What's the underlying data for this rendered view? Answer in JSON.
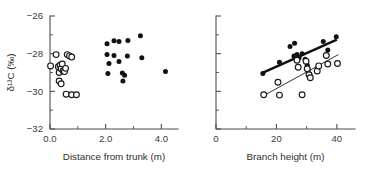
{
  "figure": {
    "background": "#ffffff",
    "marker_filled_color": "#111111",
    "marker_open_stroke": "#1a1a1a",
    "axis_color": "#4d4d4d"
  },
  "chart_data": [
    {
      "type": "scatter",
      "panel": "left",
      "title": "",
      "xlabel": "Distance from trunk (m)",
      "ylabel": "δ¹³C (‰)",
      "xlim": [
        0.0,
        4.6
      ],
      "ylim": [
        -32,
        -26
      ],
      "grid": false,
      "legend": "none",
      "xticks": [
        0.0,
        2.0,
        4.0
      ],
      "xtick_labels": [
        "0.0",
        "2.0",
        "4.0"
      ],
      "xminor": [
        1.0,
        3.0
      ],
      "yticks": [
        -26,
        -28,
        -30,
        -32
      ],
      "ytick_labels": [
        "−26",
        "−28",
        "−30",
        "−32"
      ],
      "yminor": [
        -27,
        -29,
        -31
      ],
      "series": [
        {
          "name": "open circles",
          "marker": "open-circle",
          "points": [
            [
              0.02,
              -28.65
            ],
            [
              0.22,
              -28.05
            ],
            [
              0.3,
              -28.7
            ],
            [
              0.33,
              -29.0
            ],
            [
              0.36,
              -28.62
            ],
            [
              0.4,
              -28.8
            ],
            [
              0.44,
              -28.55
            ],
            [
              0.47,
              -28.92
            ],
            [
              0.33,
              -29.45
            ],
            [
              0.4,
              -29.6
            ],
            [
              0.52,
              -28.95
            ],
            [
              0.56,
              -28.78
            ],
            [
              0.62,
              -28.05
            ],
            [
              0.7,
              -28.12
            ],
            [
              0.78,
              -28.18
            ],
            [
              0.58,
              -30.15
            ],
            [
              0.78,
              -30.18
            ],
            [
              0.95,
              -30.18
            ]
          ]
        },
        {
          "name": "filled circles",
          "marker": "filled-circle",
          "points": [
            [
              2.05,
              -27.48
            ],
            [
              2.3,
              -27.32
            ],
            [
              2.48,
              -27.35
            ],
            [
              2.8,
              -27.3
            ],
            [
              3.25,
              -27.05
            ],
            [
              2.05,
              -28.05
            ],
            [
              2.3,
              -28.1
            ],
            [
              2.12,
              -28.52
            ],
            [
              2.48,
              -28.42
            ],
            [
              2.78,
              -28.12
            ],
            [
              3.3,
              -28.22
            ],
            [
              2.08,
              -29.05
            ],
            [
              2.6,
              -29.02
            ],
            [
              2.68,
              -29.15
            ],
            [
              2.62,
              -29.45
            ],
            [
              4.15,
              -28.95
            ]
          ]
        }
      ]
    },
    {
      "type": "scatter",
      "panel": "right",
      "title": "",
      "xlabel": "Branch height (m)",
      "ylabel": "",
      "xlim": [
        0,
        46
      ],
      "ylim": [
        -32,
        -26
      ],
      "grid": false,
      "legend": "none",
      "xticks": [
        0,
        20,
        40
      ],
      "xtick_labels": [
        "0",
        "20",
        "40"
      ],
      "xminor": [
        10,
        30
      ],
      "yticks": [
        -26,
        -28,
        -30,
        -32
      ],
      "ytick_labels": [
        "",
        "",
        "",
        ""
      ],
      "yminor": [
        -27,
        -29,
        -31
      ],
      "series": [
        {
          "name": "filled circles",
          "marker": "filled-circle",
          "points": [
            [
              15.5,
              -29.05
            ],
            [
              21.0,
              -28.45
            ],
            [
              24.5,
              -27.62
            ],
            [
              26.0,
              -27.45
            ],
            [
              25.8,
              -28.12
            ],
            [
              26.8,
              -28.05
            ],
            [
              27.5,
              -28.22
            ],
            [
              28.5,
              -28.0
            ],
            [
              29.5,
              -28.3
            ],
            [
              30.2,
              -28.62
            ],
            [
              30.5,
              -28.85
            ],
            [
              31.0,
              -29.08
            ],
            [
              33.5,
              -28.95
            ],
            [
              35.5,
              -27.35
            ],
            [
              37.0,
              -27.8
            ],
            [
              39.8,
              -27.1
            ]
          ]
        },
        {
          "name": "open circles",
          "marker": "open-circle",
          "points": [
            [
              15.8,
              -30.18
            ],
            [
              20.5,
              -29.52
            ],
            [
              21.0,
              -30.2
            ],
            [
              26.8,
              -28.35
            ],
            [
              27.2,
              -28.72
            ],
            [
              28.5,
              -30.18
            ],
            [
              29.8,
              -28.4
            ],
            [
              30.2,
              -28.8
            ],
            [
              30.8,
              -29.12
            ],
            [
              31.2,
              -29.28
            ],
            [
              33.5,
              -28.92
            ],
            [
              34.0,
              -28.65
            ],
            [
              36.5,
              -28.1
            ],
            [
              37.0,
              -28.55
            ],
            [
              40.2,
              -28.52
            ]
          ]
        }
      ],
      "fit_lines": [
        {
          "name": "upper regression (filled)",
          "style": "thick",
          "x1": 15.0,
          "y1": -29.05,
          "x2": 40.0,
          "y2": -27.25
        },
        {
          "name": "lower regression (open)",
          "style": "thin",
          "x1": 15.5,
          "y1": -30.25,
          "x2": 40.5,
          "y2": -28.05
        }
      ]
    }
  ]
}
